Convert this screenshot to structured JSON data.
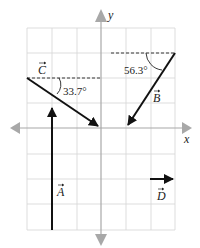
{
  "diagram": {
    "type": "vector-diagram",
    "grid": {
      "x_min": -3,
      "x_max": 3,
      "y_min": -4,
      "y_max": 4,
      "spacing_units": 1
    },
    "axes": {
      "x_label": "x",
      "y_label": "y"
    },
    "vectors": [
      {
        "name": "A",
        "label": "A",
        "from": [
          -2,
          -4
        ],
        "to": [
          -2,
          -1
        ]
      },
      {
        "name": "B",
        "label": "B",
        "from": [
          3,
          3
        ],
        "to": [
          1,
          0
        ],
        "angle_label": "56.3°"
      },
      {
        "name": "C",
        "label": "C",
        "from": [
          -3,
          2
        ],
        "to": [
          0,
          0
        ],
        "angle_label": "33.7°"
      },
      {
        "name": "D",
        "label": "D",
        "from": [
          2,
          -2
        ],
        "to": [
          3,
          -2
        ]
      }
    ],
    "colors": {
      "axis": "#a8a8a8",
      "grid": "#d0d0d0",
      "vector": "#111111"
    }
  }
}
